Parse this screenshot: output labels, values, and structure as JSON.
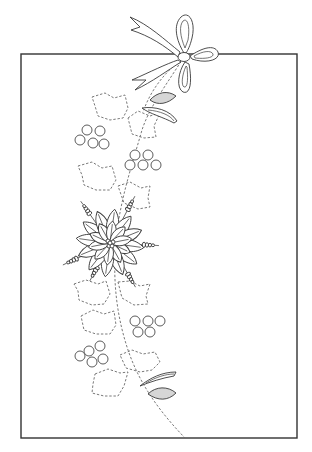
{
  "illustration": {
    "subject": "holly and poinsettia garland pattern with ribbon bow",
    "background": "#ffffff",
    "line_color": "#3a3a3a",
    "shade_color": "#d6d6d6",
    "frame": {
      "x": 21,
      "y": 54,
      "width": 276,
      "height": 384,
      "stroke": "#333333"
    },
    "stem_path": "M183,58 C170,80 150,105 142,130 C132,165 120,200 116,240 C112,285 118,320 128,350 C140,385 160,412 185,438",
    "stem_branch_path": "M176,64 C162,76 150,92 143,112",
    "berry_clusters": [
      {
        "name": "berries-upper-left",
        "r": 5,
        "points": [
          [
            87,
            130
          ],
          [
            100,
            131
          ],
          [
            80,
            140
          ],
          [
            93,
            143
          ],
          [
            104,
            144
          ]
        ]
      },
      {
        "name": "berries-upper-right",
        "r": 5,
        "points": [
          [
            135,
            155
          ],
          [
            148,
            155
          ],
          [
            130,
            165
          ],
          [
            143,
            165
          ],
          [
            156,
            165
          ]
        ]
      },
      {
        "name": "berries-lower-right",
        "r": 5,
        "points": [
          [
            135,
            321
          ],
          [
            148,
            321
          ],
          [
            160,
            321
          ],
          [
            138,
            332
          ],
          [
            150,
            332
          ]
        ]
      },
      {
        "name": "berries-lower-left",
        "r": 5,
        "points": [
          [
            100,
            346
          ],
          [
            89,
            351
          ],
          [
            80,
            356
          ],
          [
            92,
            362
          ],
          [
            103,
            359
          ]
        ]
      }
    ],
    "holly_leaves": [
      "M92,97 L105,93 L114,98 L125,95 L128,108 L123,118 L110,120 L98,116 L95,106 Z",
      "M128,118 L138,111 L150,116 L160,113 L154,126 L156,137 L144,138 L132,134 Z",
      "M78,166 L92,162 L102,168 L112,166 L116,180 L110,190 L96,190 L84,185 L82,175 Z",
      "M118,186 L130,182 L141,188 L150,186 L148,198 L150,207 L138,209 L124,203 Z",
      "M74,284 L86,280 L98,284 L106,281 L110,294 L104,304 L92,305 L79,300 L78,291 Z",
      "M118,282 L130,281 L140,286 L150,284 L146,296 L148,304 L134,305 L122,298 Z",
      "M81,316 L93,310 L104,314 L114,311 L116,325 L110,334 L96,334 L84,330 Z",
      "M120,355 L132,350 L143,354 L155,352 L160,362 L152,370 L140,372 L126,368 Z",
      "M95,374 L108,369 L120,373 L128,372 L124,386 L118,396 L104,396 L92,393 L93,384 Z"
    ],
    "bow": {
      "ribbon_tails": [
        "M178,57 C165,46 150,36 131,30 L140,27 L130,17 C148,24 165,40 180,52 Z",
        "M178,60 C166,64 150,72 132,80 L146,80 L135,90 C152,82 168,70 181,62 Z"
      ],
      "loops": [
        "M184,53 C176,40 173,25 181,17 C189,10 196,22 192,38 C190,46 188,50 186,53 Z",
        "M190,56 C202,48 214,44 218,52 C221,60 206,64 192,59 Z",
        "M185,62 C178,72 176,88 183,92 C191,95 192,80 189,64 Z"
      ],
      "inner_loops": [
        "M185,48 C180,36 179,26 183,21 C188,17 190,28 188,40 Z",
        "M194,56 C203,51 211,50 213,54 C214,58 204,59 195,58 Z",
        "M186,66 C182,75 181,85 184,87 C188,88 188,78 187,67 Z"
      ],
      "knot": {
        "cx": 184,
        "cy": 57,
        "rx": 6,
        "ry": 4.5
      }
    },
    "buds": [
      {
        "name": "bud-top",
        "shaded": "M150,100 C157,92 168,90 176,96 C168,104 158,106 150,100 Z",
        "open": "M142,108 C155,106 170,110 177,121 L174,123 C163,117 150,114 142,108 Z",
        "open_inner": "M148,110 C160,111 170,115 174,121"
      },
      {
        "name": "bud-bottom",
        "shaded": "M148,394 C156,386 168,386 176,393 C168,401 158,401 148,394 Z",
        "open": "M140,386 C150,378 162,372 176,372 L174,376 C162,378 150,382 140,386 Z",
        "open_inner": "M146,383 C156,377 166,374 174,374"
      }
    ],
    "poinsettia": {
      "center": [
        110,
        243
      ],
      "petal_count": 12,
      "petal_length": 34,
      "petal_width": 8,
      "inner_petal_count": 10,
      "inner_petal_length": 22,
      "stamens": [
        {
          "angle": -62,
          "length": 48
        },
        {
          "angle": -125,
          "length": 46
        },
        {
          "angle": 3,
          "length": 44
        },
        {
          "angle": 155,
          "length": 47
        },
        {
          "angle": 60,
          "length": 46
        },
        {
          "angle": 118,
          "length": 38
        }
      ]
    }
  }
}
